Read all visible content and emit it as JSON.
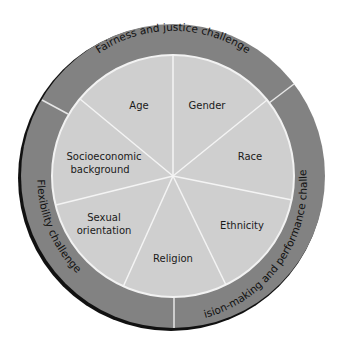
{
  "diagram": {
    "center": [
      173,
      176
    ],
    "outer_radius": 152,
    "inner_radius": 121,
    "colors": {
      "ring": "#828282",
      "pie": "#cfcfcf",
      "divider": "#f2f2f2",
      "shadow": "#111111"
    },
    "segments": [
      {
        "label": "Gender",
        "lines": [
          "Gender"
        ]
      },
      {
        "label": "Race",
        "lines": [
          "Race"
        ]
      },
      {
        "label": "Ethnicity",
        "lines": [
          "Ethnicity"
        ]
      },
      {
        "label": "Religion",
        "lines": [
          "Religion"
        ]
      },
      {
        "label": "Sexual orientation",
        "lines": [
          "Sexual",
          "orientation"
        ]
      },
      {
        "label": "Socioeconomic background",
        "lines": [
          "Socioeconomic",
          "background"
        ]
      },
      {
        "label": "Age",
        "lines": [
          "Age"
        ]
      }
    ],
    "ring_sections": [
      {
        "label": "Fairness and justice challenge"
      },
      {
        "label": "Decision-making and performance challenge"
      },
      {
        "label": "Flexibility challenge"
      }
    ]
  }
}
